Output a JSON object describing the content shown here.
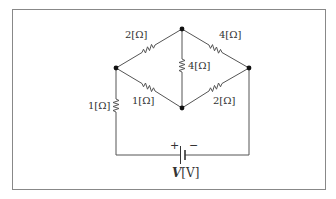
{
  "diagram": {
    "type": "circuit",
    "frame": {
      "x": 12,
      "y": 9,
      "width": 314,
      "height": 181,
      "stroke": "#888888"
    },
    "wire_color": "#555555",
    "node_color": "#111111",
    "nodes": [
      {
        "id": "left",
        "x": 116,
        "y": 68
      },
      {
        "id": "top",
        "x": 182,
        "y": 29
      },
      {
        "id": "right",
        "x": 249,
        "y": 68
      },
      {
        "id": "bottom",
        "x": 182,
        "y": 108
      }
    ],
    "resistors": [
      {
        "id": "r_left_top",
        "label": "2[Ω]",
        "from": "left",
        "to": "top"
      },
      {
        "id": "r_top_right",
        "label": "4[Ω]",
        "from": "top",
        "to": "right"
      },
      {
        "id": "r_top_bottom",
        "label": "4[Ω]",
        "from": "top",
        "to": "bottom"
      },
      {
        "id": "r_left_bottom",
        "label": "1[Ω]",
        "from": "left",
        "to": "bottom"
      },
      {
        "id": "r_right_bottom",
        "label": "2[Ω]",
        "from": "right",
        "to": "bottom"
      },
      {
        "id": "r_left_series",
        "label": "1[Ω]",
        "from": "left",
        "to": "battery_plus"
      }
    ],
    "source": {
      "type": "battery",
      "label_var": "V",
      "label_unit": "[V]",
      "plus": "+",
      "minus": "−"
    }
  }
}
